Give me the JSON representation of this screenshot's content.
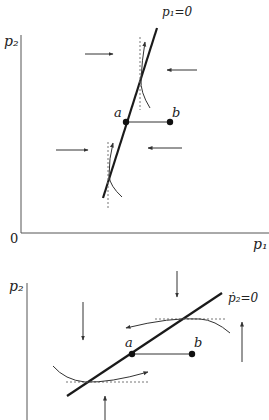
{
  "colors": {
    "ink": "#1a1a1a",
    "axis": "#555555",
    "dotted": "#777777",
    "arrow": "#333333"
  },
  "top_diagram": {
    "y_axis_label": "p₂",
    "x_axis_label": "p₁",
    "origin_label": "0",
    "locus_label": "p₁=0",
    "point_a_label": "a",
    "point_b_label": "b",
    "arrows": [
      {
        "direction": "right",
        "x1": 85,
        "y1": 54,
        "x2": 113,
        "y2": 54
      },
      {
        "direction": "left",
        "x1": 197,
        "y1": 70,
        "x2": 167,
        "y2": 70
      },
      {
        "direction": "right",
        "x1": 56,
        "y1": 150,
        "x2": 88,
        "y2": 150
      },
      {
        "direction": "left",
        "x1": 182,
        "y1": 148,
        "x2": 148,
        "y2": 148
      }
    ]
  },
  "bottom_diagram": {
    "y_axis_label": "p₂",
    "locus_label": "ṗ₂=0",
    "point_a_label": "a",
    "point_b_label": "b",
    "arrows": [
      {
        "direction": "down",
        "x1": 177,
        "y1": 271,
        "x2": 177,
        "y2": 297
      },
      {
        "direction": "down",
        "x1": 83,
        "y1": 302,
        "x2": 83,
        "y2": 340
      },
      {
        "direction": "up",
        "x1": 242,
        "y1": 362,
        "x2": 242,
        "y2": 322
      },
      {
        "direction": "up",
        "x1": 105,
        "y1": 420,
        "x2": 105,
        "y2": 396
      }
    ]
  }
}
